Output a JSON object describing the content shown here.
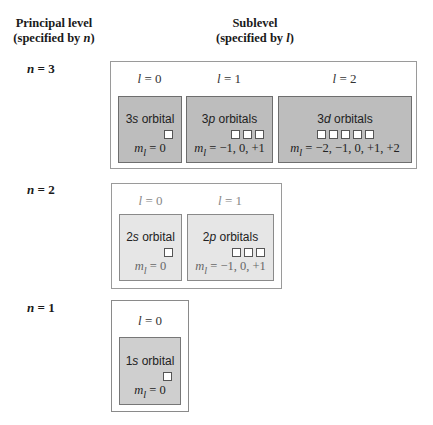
{
  "headers": {
    "principal": {
      "line1": "Principal level",
      "line2_prefix": "(specified by ",
      "line2_var": "n",
      "line2_suffix": ")"
    },
    "sublevel": {
      "line1": "Sublevel",
      "line2_prefix": "(specified by ",
      "line2_var": "l",
      "line2_suffix": ")"
    }
  },
  "levels": [
    {
      "n_label": "n = 3",
      "n_var": "n",
      "n_eq": " = 3",
      "sublevels": [
        {
          "l_label": "l = 0",
          "orbital_num": "3",
          "orbital_letter": "s",
          "orbital_suffix": " orbital",
          "ml_label": "m",
          "ml_sub": "l",
          "ml_values": " = 0",
          "count": 1
        },
        {
          "l_label": "l = 1",
          "orbital_num": "3",
          "orbital_letter": "p",
          "orbital_suffix": " orbitals",
          "ml_label": "m",
          "ml_sub": "l",
          "ml_values": " = −1, 0, +1",
          "count": 3
        },
        {
          "l_label": "l = 2",
          "orbital_num": "3",
          "orbital_letter": "d",
          "orbital_suffix": " orbitals",
          "ml_label": "m",
          "ml_sub": "l",
          "ml_values": " = −2, −1, 0, +1, +2",
          "count": 5
        }
      ]
    },
    {
      "n_label": "n = 2",
      "n_var": "n",
      "n_eq": " = 2",
      "sublevels": [
        {
          "l_label": "l = 0",
          "orbital_num": "2",
          "orbital_letter": "s",
          "orbital_suffix": " orbital",
          "ml_label": "m",
          "ml_sub": "l",
          "ml_values": " = 0",
          "count": 1
        },
        {
          "l_label": "l = 1",
          "orbital_num": "2",
          "orbital_letter": "p",
          "orbital_suffix": " orbitals",
          "ml_label": "m",
          "ml_sub": "l",
          "ml_values": " = −1, 0, +1",
          "count": 3
        }
      ]
    },
    {
      "n_label": "n = 1",
      "n_var": "n",
      "n_eq": " = 1",
      "sublevels": [
        {
          "l_label": "l = 0",
          "orbital_num": "1",
          "orbital_letter": "s",
          "orbital_suffix": " orbital",
          "ml_label": "m",
          "ml_sub": "l",
          "ml_values": " = 0",
          "count": 1
        }
      ]
    }
  ],
  "colors": {
    "n3_fill": "#bdbdbd",
    "n2_fill": "#e6e6e6",
    "n1_fill": "#cfcfcf",
    "outer_border": "#9a9a9a"
  }
}
